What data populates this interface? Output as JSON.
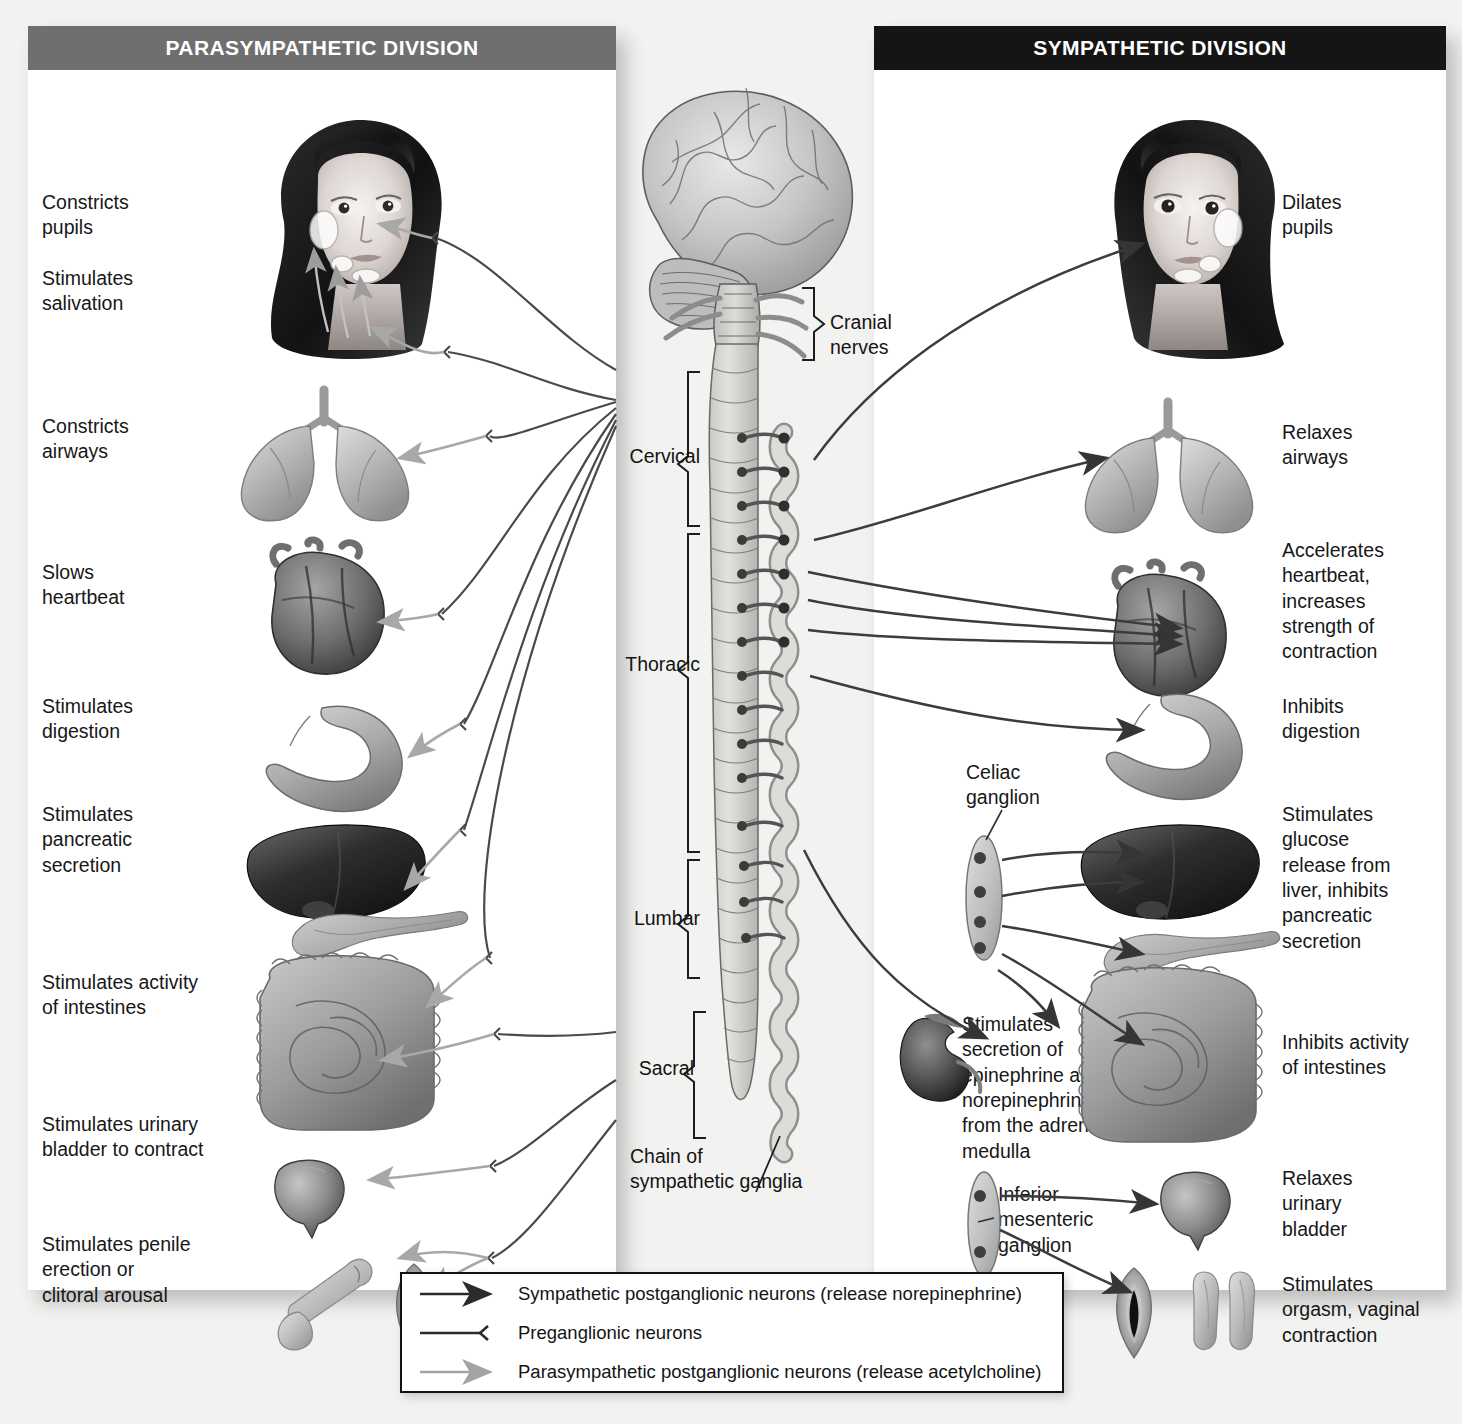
{
  "figure": {
    "type": "anatomical-diagram"
  },
  "panels": {
    "parasympathetic": {
      "title": "PARASYMPATHETIC DIVISION",
      "header_color": "#6f6f6f",
      "effects": [
        {
          "id": "pupils",
          "text": "Constricts\npupils",
          "organ": "eye"
        },
        {
          "id": "salivation",
          "text": "Stimulates\nsalivation",
          "organ": "salivary-gland"
        },
        {
          "id": "airways",
          "text": "Constricts\nairways",
          "organ": "lungs"
        },
        {
          "id": "heart",
          "text": "Slows\nheartbeat",
          "organ": "heart"
        },
        {
          "id": "digestion",
          "text": "Stimulates\ndigestion",
          "organ": "stomach"
        },
        {
          "id": "pancreas",
          "text": "Stimulates\npancreatic\nsecretion",
          "organ": "liver-pancreas"
        },
        {
          "id": "intestines",
          "text": "Stimulates activity\nof intestines",
          "organ": "intestines"
        },
        {
          "id": "bladder",
          "text": "Stimulates urinary\nbladder to contract",
          "organ": "bladder"
        },
        {
          "id": "genitals",
          "text": "Stimulates penile\nerection or\nclitoral arousal",
          "organ": "genitals"
        }
      ]
    },
    "sympathetic": {
      "title": "SYMPATHETIC DIVISION",
      "header_color": "#151515",
      "effects": [
        {
          "id": "pupils",
          "text": "Dilates\npupils",
          "organ": "eye"
        },
        {
          "id": "airways",
          "text": "Relaxes\nairways",
          "organ": "lungs"
        },
        {
          "id": "heart",
          "text": "Accelerates\nheartbeat,\nincreases\nstrength of\ncontraction",
          "organ": "heart"
        },
        {
          "id": "digestion",
          "text": "Inhibits\ndigestion",
          "organ": "stomach"
        },
        {
          "id": "liver",
          "text": "Stimulates\nglucose\nrelease from\nliver, inhibits\npancreatic\nsecretion",
          "organ": "liver-pancreas"
        },
        {
          "id": "intestines",
          "text": "Inhibits activity\nof intestines",
          "organ": "intestines"
        },
        {
          "id": "bladder",
          "text": "Relaxes\nurinary\nbladder",
          "organ": "bladder"
        },
        {
          "id": "genitals",
          "text": "Stimulates\norgasm, vaginal\ncontraction",
          "organ": "genitals"
        }
      ],
      "inline_labels": [
        {
          "id": "celiac",
          "text": "Celiac\nganglion"
        },
        {
          "id": "adrenal",
          "text": "Stimulates\nsecretion of\nepinephrine and\nnorepinephrine\nfrom the adrenal\nmedulla"
        },
        {
          "id": "inferior-mesenteric",
          "text": "Inferior\nmesenteric\nganglion"
        }
      ]
    }
  },
  "center": {
    "labels": [
      {
        "id": "cranial-nerves",
        "text": "Cranial\nnerves"
      },
      {
        "id": "cervical",
        "text": "Cervical"
      },
      {
        "id": "thoracic",
        "text": "Thoracic"
      },
      {
        "id": "lumbar",
        "text": "Lumbar"
      },
      {
        "id": "sacral",
        "text": "Sacral"
      },
      {
        "id": "chain",
        "text": "Chain of\nsympathetic ganglia"
      }
    ]
  },
  "legend": {
    "items": [
      {
        "id": "sympathetic-post",
        "text": "Sympathetic postganglionic neurons (release norepinephrine)",
        "style": "dark-arrow",
        "color": "#3a3a3a"
      },
      {
        "id": "preganglionic",
        "text": "Preganglionic neurons",
        "style": "dark-fork",
        "color": "#2a2a2a"
      },
      {
        "id": "parasympathetic-post",
        "text": "Parasympathetic postganglionic neurons (release acetylcholine)",
        "style": "light-arrow",
        "color": "#a3a3a3"
      }
    ]
  },
  "colors": {
    "page_background": "#f2f2f0",
    "panel_background": "#ffffff",
    "dark_nerve": "#3c3c3c",
    "light_nerve": "#a8a8a8",
    "organ_gray": "#b9b9b9",
    "organ_dark": "#4a4a4a"
  }
}
